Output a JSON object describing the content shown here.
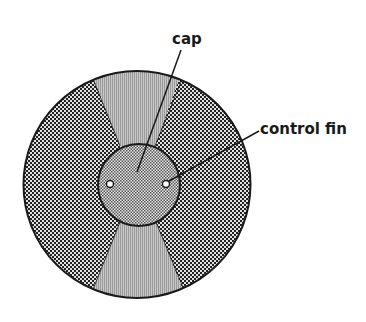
{
  "diagram": {
    "type": "cross-section",
    "colors": {
      "outline": "#1a1a1a",
      "dot_fill": "#222222",
      "dot_background": "#e2e2e2",
      "stripe_light": "#c8c8c8",
      "stripe_dark": "#9a9a9a",
      "cap_dot": "#333333",
      "cap_background": "#e8e8e8",
      "hole_fill": "#ffffff"
    },
    "labels": {
      "cap": "cap",
      "control_fin": "control fin"
    },
    "components": [
      {
        "id": "outer-disk",
        "shape": "circle",
        "pattern": "dots"
      },
      {
        "id": "top-wedge",
        "shape": "wedge",
        "pattern": "vertical-stripes"
      },
      {
        "id": "bottom-wedge",
        "shape": "wedge",
        "pattern": "vertical-stripes"
      },
      {
        "id": "cap",
        "shape": "circle",
        "pattern": "fine-checker"
      },
      {
        "id": "control-fin-left",
        "shape": "small-circle",
        "pattern": "hollow"
      },
      {
        "id": "control-fin-right",
        "shape": "small-circle",
        "pattern": "hollow"
      }
    ]
  }
}
